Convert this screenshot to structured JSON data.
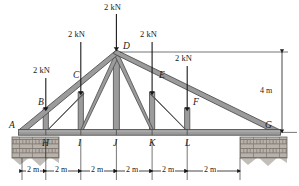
{
  "figure": {
    "type": "truss-loading-diagram",
    "span_m": 12,
    "height_m": 4,
    "bay_count": 6,
    "bay_length_label": "2 m",
    "height_label": "4 m",
    "member_color": "#9b9b9b",
    "member_edge_color": "#4a4a4a",
    "support_color": "#b9b2ac",
    "line_color": "#1a1a1a"
  },
  "joints": [
    {
      "id": "A",
      "label": "A",
      "x_m": 0,
      "y_m": 0,
      "chord": "bottom"
    },
    {
      "id": "H",
      "label": "H",
      "x_m": 2,
      "y_m": 0,
      "chord": "bottom"
    },
    {
      "id": "I",
      "label": "I",
      "x_m": 4,
      "y_m": 0,
      "chord": "bottom"
    },
    {
      "id": "J",
      "label": "J",
      "x_m": 6,
      "y_m": 0,
      "chord": "bottom"
    },
    {
      "id": "K",
      "label": "K",
      "x_m": 8,
      "y_m": 0,
      "chord": "bottom"
    },
    {
      "id": "L",
      "label": "L",
      "x_m": 10,
      "y_m": 0,
      "chord": "bottom"
    },
    {
      "id": "G",
      "label": "G",
      "x_m": 12,
      "y_m": 0,
      "chord": "bottom"
    },
    {
      "id": "B",
      "label": "B",
      "x_m": 2,
      "y_m": 0.6667,
      "chord": "top"
    },
    {
      "id": "C",
      "label": "C",
      "x_m": 4,
      "y_m": 1.3333,
      "chord": "top"
    },
    {
      "id": "D",
      "label": "D",
      "x_m": 6,
      "y_m": 4,
      "chord": "top"
    },
    {
      "id": "E",
      "label": "E",
      "x_m": 8,
      "y_m": 1.3333,
      "chord": "top"
    },
    {
      "id": "F",
      "label": "F",
      "x_m": 10,
      "y_m": 0.6667,
      "chord": "top"
    }
  ],
  "loads": [
    {
      "joint": "B",
      "label": "2 kN",
      "magnitude": 2,
      "unit": "kN",
      "direction": "down"
    },
    {
      "joint": "C",
      "label": "2 kN",
      "magnitude": 2,
      "unit": "kN",
      "direction": "down"
    },
    {
      "joint": "D",
      "label": "2 kN",
      "magnitude": 2,
      "unit": "kN",
      "direction": "down"
    },
    {
      "joint": "E",
      "label": "2 kN",
      "magnitude": 2,
      "unit": "kN",
      "direction": "down"
    },
    {
      "joint": "F",
      "label": "2 kN",
      "magnitude": 2,
      "unit": "kN",
      "direction": "down"
    }
  ],
  "dimensions": {
    "horizontal": [
      "2 m",
      "2 m",
      "2 m",
      "2 m",
      "2 m",
      "2 m"
    ],
    "vertical": "4 m"
  },
  "supports": [
    {
      "joint": "A",
      "kind": "masonry-block"
    },
    {
      "joint": "G",
      "kind": "masonry-block"
    }
  ]
}
